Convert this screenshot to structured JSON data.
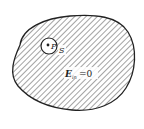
{
  "diagram": {
    "labels": {
      "point": "P",
      "surface": "S",
      "field_symbol": "E",
      "field_subscript": "in",
      "field_equals": "=0"
    },
    "colors": {
      "stroke": "#222222",
      "hatch": "#555555",
      "background": "#ffffff"
    }
  }
}
